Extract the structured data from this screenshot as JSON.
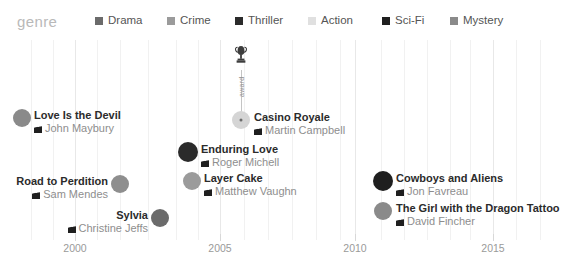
{
  "legend": {
    "title": "genre",
    "items": [
      {
        "label": "Drama",
        "color": "#6b6b6b",
        "x": 95
      },
      {
        "label": "Crime",
        "color": "#9b9b9b",
        "x": 167
      },
      {
        "label": "Thriller",
        "color": "#2b2b2b",
        "x": 235
      },
      {
        "label": "Action",
        "color": "#e0e0e0",
        "x": 308
      },
      {
        "label": "Sci-Fi",
        "color": "#1f1f1f",
        "x": 382
      },
      {
        "label": "Mystery",
        "color": "#8a8a8a",
        "x": 450
      }
    ]
  },
  "axis": {
    "ticks": [
      {
        "label": "2000",
        "x": 75
      },
      {
        "label": "2005",
        "x": 220
      },
      {
        "label": "2010",
        "x": 355
      },
      {
        "label": "2015",
        "x": 493
      }
    ],
    "gridlines_x": [
      31,
      53,
      75,
      97,
      120,
      148,
      176,
      198,
      220,
      244,
      268,
      292,
      316,
      340,
      355,
      381,
      404,
      427,
      450,
      470,
      493,
      516,
      540
    ]
  },
  "annotation": {
    "label": "award",
    "icon": "trophy-icon",
    "x": 241,
    "line_top": 30,
    "line_height": 45
  },
  "chart_data": {
    "type": "scatter",
    "title": "genre",
    "xlabel": "",
    "ylabel": "",
    "xlim": [
      1997,
      2016
    ],
    "grid": true,
    "legend_position": "top",
    "series": [
      {
        "name": "Drama",
        "color": "#6b6b6b"
      },
      {
        "name": "Crime",
        "color": "#9b9b9b"
      },
      {
        "name": "Thriller",
        "color": "#2b2b2b"
      },
      {
        "name": "Action",
        "color": "#e0e0e0"
      },
      {
        "name": "Sci-Fi",
        "color": "#1f1f1f"
      },
      {
        "name": "Mystery",
        "color": "#8a8a8a"
      }
    ],
    "points": [
      {
        "title": "Love Is the Devil",
        "director": "John Maybury",
        "genre": "Mystery",
        "color": "#8a8a8a",
        "x": 22,
        "y": 78,
        "r": 9,
        "side": "right",
        "label_x": 34,
        "label_y": 70
      },
      {
        "title": "Casino Royale",
        "director": "Martin Campbell",
        "genre": "Action",
        "color": "#d5d5d5",
        "x": 241,
        "y": 80,
        "r": 9,
        "side": "right",
        "label_x": 254,
        "label_y": 72,
        "has_dot": true
      },
      {
        "title": "Enduring Love",
        "director": "Roger Michell",
        "genre": "Thriller",
        "color": "#2b2b2b",
        "x": 188,
        "y": 112,
        "r": 10,
        "side": "right",
        "label_x": 201,
        "label_y": 104
      },
      {
        "title": "Road to Perdition",
        "director": "Sam Mendes",
        "genre": "Mystery",
        "color": "#8e8e8e",
        "x": 120,
        "y": 144,
        "r": 9,
        "side": "left",
        "label_x": 108,
        "label_y": 136
      },
      {
        "title": "Layer Cake",
        "director": "Matthew Vaughn",
        "genre": "Crime",
        "color": "#9b9b9b",
        "x": 192,
        "y": 141,
        "r": 9,
        "side": "right",
        "label_x": 204,
        "label_y": 133
      },
      {
        "title": "Sylvia",
        "director": "Christine Jeffs",
        "genre": "Drama",
        "color": "#6b6b6b",
        "x": 160,
        "y": 178,
        "r": 9,
        "side": "left",
        "label_x": 148,
        "label_y": 170
      },
      {
        "title": "Cowboys and Aliens",
        "director": "Jon Favreau",
        "genre": "Sci-Fi",
        "color": "#1f1f1f",
        "x": 383,
        "y": 141,
        "r": 10,
        "side": "right",
        "label_x": 396,
        "label_y": 133
      },
      {
        "title": "The Girl with the Dragon Tattoo",
        "director": "David Fincher",
        "genre": "Mystery",
        "color": "#8a8a8a",
        "x": 383,
        "y": 171,
        "r": 9,
        "side": "right",
        "label_x": 396,
        "label_y": 163
      }
    ]
  }
}
